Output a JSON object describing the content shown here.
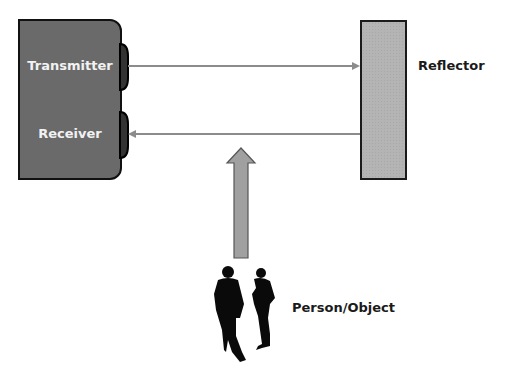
{
  "diagram": {
    "transceiver": {
      "transmitter_label": "Transmitter",
      "receiver_label": "Receiver"
    },
    "reflector_label": "Reflector",
    "object_label": "Person/Object",
    "beams": [
      {
        "name": "transmitted-beam",
        "direction": "to-reflector"
      },
      {
        "name": "reflected-beam",
        "direction": "to-receiver"
      }
    ],
    "interrupt_arrow": {
      "direction": "up"
    },
    "colors": {
      "device_fill": "#6a6a6a",
      "reflector_fill": "#b4b4b4",
      "beam": "#8c8c8c",
      "arrow_fill": "#a0a0a0",
      "silhouette": "#0a0a0a"
    }
  }
}
